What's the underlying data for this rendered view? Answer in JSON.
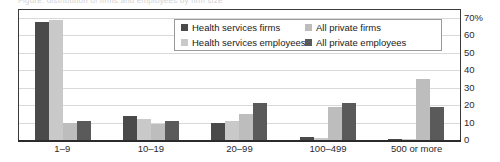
{
  "title_fragment": "Figure: distribution of firms and employees by firm size",
  "legend": {
    "position": "inside-top-center",
    "items": [
      {
        "label": "Health services firms",
        "color": "#4a4a4a",
        "name": "legend-health-services-firms"
      },
      {
        "label": "Health services employees",
        "color": "#c9c9c9",
        "name": "legend-health-services-employees"
      },
      {
        "label": "All private firms",
        "color": "#bdbdbd",
        "name": "legend-all-private-firms"
      },
      {
        "label": "All private employees",
        "color": "#5a5a5a",
        "name": "legend-all-private-employees"
      }
    ]
  },
  "axis": {
    "y_ticks": [
      "70%",
      "60",
      "50",
      "40",
      "30",
      "20",
      "10",
      "0"
    ],
    "x_ticks": [
      "1–9",
      "10–19",
      "20–99",
      "100–499",
      "500 or more"
    ]
  },
  "chart_data": {
    "type": "bar",
    "title": "",
    "subtitle": "",
    "xlabel": "",
    "ylabel": "",
    "ylim": [
      0,
      70
    ],
    "yticks": [
      0,
      10,
      20,
      30,
      40,
      50,
      60,
      70
    ],
    "ytick_labels": [
      "0",
      "10",
      "20",
      "30",
      "40",
      "50",
      "60",
      "70%"
    ],
    "grid": true,
    "grid_axis": "y",
    "legend_position": "inside-top-center",
    "categories": [
      "1–9",
      "10–19",
      "20–99",
      "100–499",
      "500 or more"
    ],
    "series": [
      {
        "name": "Health services firms",
        "color": "#4a4a4a",
        "values": [
          68,
          14,
          10,
          2,
          0.5
        ]
      },
      {
        "name": "Health services employees",
        "color": "#c9c9c9",
        "values": [
          69,
          12,
          11,
          1,
          0.5
        ]
      },
      {
        "name": "All private firms",
        "color": "#bdbdbd",
        "values": [
          10,
          9,
          15,
          19,
          35
        ]
      },
      {
        "name": "All private employees",
        "color": "#5a5a5a",
        "values": [
          11,
          11,
          21,
          21,
          19
        ]
      }
    ]
  }
}
